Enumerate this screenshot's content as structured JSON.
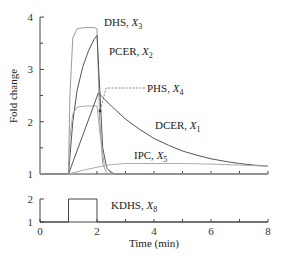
{
  "chart_data": [
    {
      "type": "line",
      "panel": "top",
      "title": "",
      "xlabel": "Time (min)",
      "ylabel": "Fold change",
      "xlim": [
        0,
        8
      ],
      "ylim": [
        1,
        4
      ],
      "yticks": [
        1,
        2,
        3,
        4
      ],
      "grid": false,
      "legend": "inline labels",
      "series": [
        {
          "name": "DHS, X3",
          "label": "DHS,",
          "sub": "3",
          "color": "#9a9a9a",
          "x": [
            0,
            1.0,
            1.05,
            1.15,
            1.3,
            1.6,
            1.9,
            2.0,
            2.1,
            2.2,
            2.35,
            8
          ],
          "y": [
            1,
            1,
            2.5,
            3.6,
            3.78,
            3.8,
            3.8,
            3.78,
            2.0,
            1.2,
            1.0,
            1.0
          ]
        },
        {
          "name": "PCER, X2",
          "label": "PCER,",
          "sub": "2",
          "color": "#555555",
          "x": [
            0,
            1.0,
            1.15,
            1.3,
            1.5,
            1.7,
            1.9,
            2.0,
            2.1,
            2.2,
            2.35,
            2.6,
            8
          ],
          "y": [
            1,
            1,
            2.0,
            2.6,
            3.05,
            3.35,
            3.58,
            3.65,
            2.6,
            1.5,
            1.1,
            1.0,
            1.0
          ]
        },
        {
          "name": "PHS, X4",
          "label": "PHS,",
          "sub": "4",
          "color": "#aaaaaa",
          "x": [
            0,
            1.0,
            1.05,
            1.15,
            1.3,
            1.6,
            2.0,
            2.1,
            2.25,
            2.5,
            8
          ],
          "y": [
            1,
            1,
            1.7,
            2.15,
            2.28,
            2.3,
            2.3,
            1.8,
            1.2,
            1.0,
            1.0
          ]
        },
        {
          "name": "DCER, X1",
          "label": "DCER,",
          "sub": "1",
          "color": "#555555",
          "x": [
            0,
            1.0,
            2.05,
            2.5,
            3,
            3.5,
            4,
            4.5,
            5,
            5.5,
            6,
            6.5,
            7,
            7.5,
            8
          ],
          "y": [
            1,
            1,
            2.55,
            2.3,
            2.05,
            1.85,
            1.68,
            1.55,
            1.44,
            1.36,
            1.29,
            1.24,
            1.2,
            1.17,
            1.15
          ]
        },
        {
          "name": "IPC, X5",
          "label": "IPC,",
          "sub": "5",
          "color": "#aaaaaa",
          "x": [
            0,
            1.0,
            1.5,
            2.0,
            2.5,
            3.0,
            4,
            5,
            6,
            7,
            8
          ],
          "y": [
            1,
            1,
            1.07,
            1.13,
            1.18,
            1.2,
            1.2,
            1.2,
            1.19,
            1.17,
            1.15
          ]
        }
      ],
      "annotations": [
        {
          "text": "PHS, X4 arrow",
          "from": [
            3.7,
            2.48
          ],
          "to": [
            2.6,
            2.12
          ]
        }
      ]
    },
    {
      "type": "line",
      "panel": "bottom",
      "xlabel": "Time (min)",
      "xlim": [
        0,
        8
      ],
      "ylim": [
        1,
        2
      ],
      "xticks": [
        0,
        2,
        4,
        6,
        8
      ],
      "yticks": [
        1,
        2
      ],
      "series": [
        {
          "name": "KDHS, X8",
          "label": "KDHS,",
          "sub": "8",
          "color": "#444444",
          "x": [
            0,
            1,
            1,
            2,
            2,
            8
          ],
          "y": [
            1,
            1,
            2,
            2,
            1,
            1
          ]
        }
      ]
    }
  ],
  "axes": {
    "ylabel": "Fold change",
    "xlabel": "Time (min)",
    "top_yticks": [
      "1",
      "2",
      "3",
      "4"
    ],
    "bottom_yticks": [
      "1",
      "2"
    ],
    "xticks": [
      "0",
      "2",
      "4",
      "6",
      "8"
    ]
  },
  "labels": {
    "dhs": {
      "name": "DHS,",
      "var": "X",
      "sub": "3"
    },
    "pcer": {
      "name": "PCER,",
      "var": "X",
      "sub": "2"
    },
    "phs": {
      "name": "PHS,",
      "var": "X",
      "sub": "4"
    },
    "dcer": {
      "name": "DCER,",
      "var": "X",
      "sub": "1"
    },
    "ipc": {
      "name": "IPC,",
      "var": "X",
      "sub": "5"
    },
    "kdhs": {
      "name": "KDHS,",
      "var": "X",
      "sub": "8"
    }
  }
}
